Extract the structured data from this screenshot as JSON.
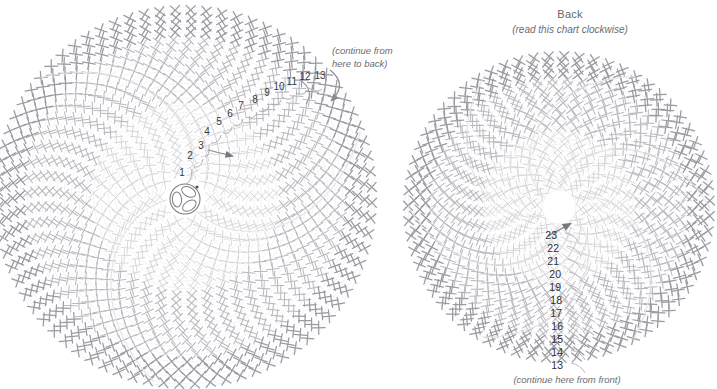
{
  "page": {
    "width": 717,
    "height": 389,
    "background": "#ffffff"
  },
  "colors": {
    "stitch_light": "#d6d6da",
    "stitch_mid": "#b9b9bf",
    "stitch_dark": "#9a9aa2",
    "guide_line": "#e7e7ea",
    "number_text": "#3a3a3e",
    "caption_text": "#6c6c71",
    "arrow": "#8b8b92",
    "ring": "#7c7c84"
  },
  "front_chart": {
    "name": "Front",
    "center_x": 185,
    "center_y": 197,
    "radius": 187,
    "sectors": 3,
    "note": "(continue from\nhere to back)",
    "note_line1": "(continue from",
    "note_line2": "here to back)",
    "round_numbers": [
      {
        "label": "1",
        "x": 182,
        "y": 172
      },
      {
        "label": "2",
        "x": 190,
        "y": 155
      },
      {
        "label": "3",
        "x": 201,
        "y": 145
      },
      {
        "label": "4",
        "x": 207,
        "y": 131
      },
      {
        "label": "5",
        "x": 219,
        "y": 121
      },
      {
        "label": "6",
        "x": 230,
        "y": 113
      },
      {
        "label": "7",
        "x": 241,
        "y": 105
      },
      {
        "label": "8",
        "x": 255,
        "y": 99
      },
      {
        "label": "9",
        "x": 267,
        "y": 92
      },
      {
        "label": "10",
        "x": 279,
        "y": 86
      },
      {
        "label": "11",
        "x": 292,
        "y": 81
      },
      {
        "label": "12",
        "x": 305,
        "y": 76
      },
      {
        "label": "13",
        "x": 320,
        "y": 75
      }
    ]
  },
  "back_chart": {
    "name": "Back",
    "title": "Back",
    "subtitle": "(read this chart clockwise)",
    "center_x": 559,
    "center_y": 207,
    "radius": 151,
    "sectors": 6,
    "note": "(continue here from front)",
    "round_numbers": [
      {
        "label": "23",
        "x": 557,
        "y": 235
      },
      {
        "label": "22",
        "x": 559,
        "y": 248
      },
      {
        "label": "21",
        "x": 559,
        "y": 261
      },
      {
        "label": "20",
        "x": 561,
        "y": 274
      },
      {
        "label": "19",
        "x": 561,
        "y": 287
      },
      {
        "label": "18",
        "x": 562,
        "y": 300
      },
      {
        "label": "17",
        "x": 562,
        "y": 313
      },
      {
        "label": "16",
        "x": 563,
        "y": 326
      },
      {
        "label": "15",
        "x": 563,
        "y": 339
      },
      {
        "label": "14",
        "x": 563,
        "y": 352
      },
      {
        "label": "13",
        "x": 563,
        "y": 365
      }
    ]
  },
  "legend": {
    "symbol_x": "single-crochet-x",
    "symbol_plus": "single-crochet-plus",
    "magic_ring": "magic-ring"
  }
}
